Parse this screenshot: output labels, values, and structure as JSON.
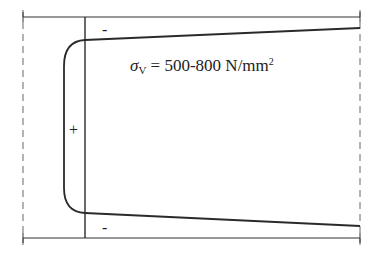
{
  "diagram": {
    "type": "stress-distribution",
    "formula": {
      "symbol": "σ",
      "subscript": "V",
      "equals": " = ",
      "value": "500-800 N/mm",
      "superscript": "2"
    },
    "signs": {
      "top": "-",
      "middle": "+",
      "bottom": "-"
    },
    "colors": {
      "line": "#2a2a2a",
      "dashed": "#555555",
      "background": "#ffffff"
    }
  }
}
